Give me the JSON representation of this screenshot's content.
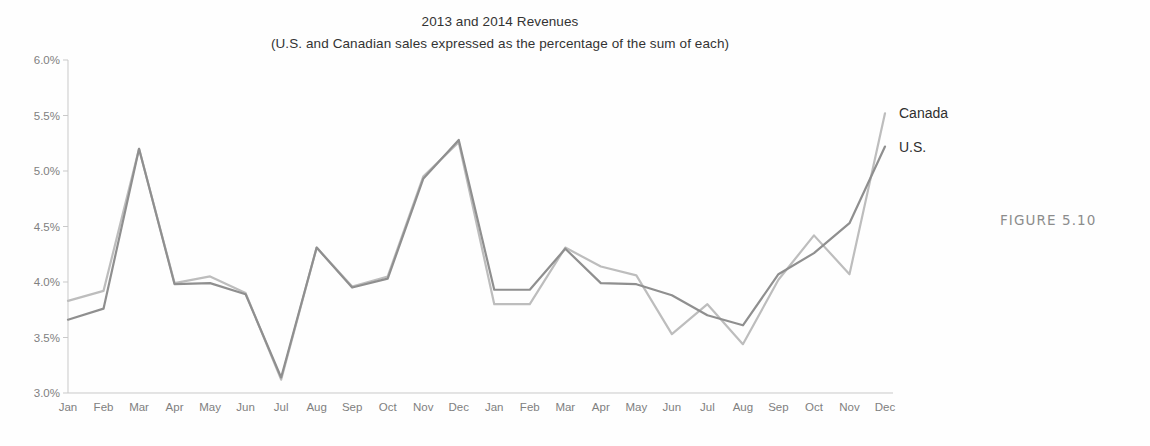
{
  "figure": {
    "caption": "FIGURE 5.10"
  },
  "chart_data": {
    "type": "line",
    "title": "2013 and 2014 Revenues",
    "subtitle": "(U.S. and Canadian sales expressed as the percentage of the sum of each)",
    "xlabel": "",
    "ylabel": "",
    "ylim": [
      3.0,
      6.0
    ],
    "ytick_step": 0.5,
    "ytick_labels": [
      "6.0%",
      "5.5%",
      "5.0%",
      "4.5%",
      "4.0%",
      "3.5%",
      "3.0%"
    ],
    "ytick_values": [
      6.0,
      5.5,
      5.0,
      4.5,
      4.0,
      3.5,
      3.0
    ],
    "grid": false,
    "legend_position": "line-end-right",
    "value_suffix": "%",
    "categories": [
      "Jan",
      "Feb",
      "Mar",
      "Apr",
      "May",
      "Jun",
      "Jul",
      "Aug",
      "Sep",
      "Oct",
      "Nov",
      "Dec",
      "Jan",
      "Feb",
      "Mar",
      "Apr",
      "May",
      "Jun",
      "Jul",
      "Aug",
      "Sep",
      "Oct",
      "Nov",
      "Dec"
    ],
    "series": [
      {
        "name": "Canada",
        "color": "#bdbdbd",
        "label_color": "#2f2f2f",
        "values": [
          3.83,
          3.92,
          5.2,
          3.99,
          4.05,
          3.9,
          3.12,
          4.31,
          3.96,
          4.05,
          4.95,
          5.26,
          3.8,
          3.8,
          4.31,
          4.14,
          4.06,
          3.53,
          3.8,
          3.44,
          4.02,
          4.42,
          4.07,
          5.52
        ]
      },
      {
        "name": "U.S.",
        "color": "#8f8f8f",
        "label_color": "#2f2f2f",
        "values": [
          3.66,
          3.76,
          5.2,
          3.98,
          3.99,
          3.89,
          3.14,
          4.31,
          3.95,
          4.03,
          4.93,
          5.28,
          3.93,
          3.93,
          4.3,
          3.99,
          3.98,
          3.88,
          3.7,
          3.61,
          4.07,
          4.26,
          4.53,
          5.22
        ]
      }
    ]
  }
}
